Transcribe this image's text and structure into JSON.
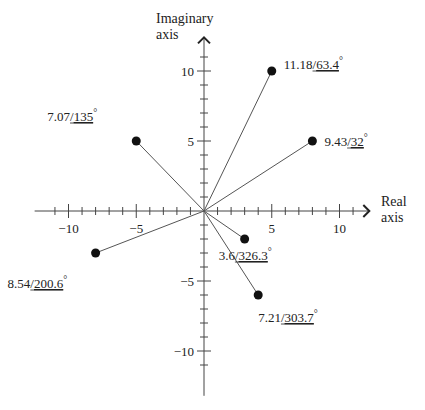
{
  "chart_data": {
    "type": "scatter",
    "title": "",
    "xlabel": [
      "Real",
      "axis"
    ],
    "ylabel": [
      "Imaginary",
      "axis"
    ],
    "xlim": [
      -12.5,
      12
    ],
    "ylim": [
      -13.3,
      12.5
    ],
    "x_ticks": [
      -10,
      -5,
      5,
      10
    ],
    "y_ticks": [
      10,
      5,
      -5,
      -10
    ],
    "x_tick_labels": [
      "−10",
      "−5",
      "5",
      "10"
    ],
    "y_tick_labels": [
      "10",
      "5",
      "−5",
      "−10"
    ],
    "minor_tick_step": 1,
    "grid": false,
    "points": [
      {
        "x": 5,
        "y": 10,
        "magnitude": "11.18",
        "angle": "63.4",
        "degree_symbol": "°"
      },
      {
        "x": -5,
        "y": 5,
        "magnitude": "7.07",
        "angle": "135",
        "degree_symbol": "°"
      },
      {
        "x": 8,
        "y": 5,
        "magnitude": "9.43",
        "angle": "32",
        "degree_symbol": "°"
      },
      {
        "x": -8,
        "y": -3,
        "magnitude": "8.54",
        "angle": "200.6",
        "degree_symbol": "°"
      },
      {
        "x": 3,
        "y": -2,
        "magnitude": "3.6",
        "angle": "326.3",
        "degree_symbol": "°"
      },
      {
        "x": 4,
        "y": -6,
        "magnitude": "7.21",
        "angle": "303.7",
        "degree_symbol": "°"
      }
    ]
  }
}
